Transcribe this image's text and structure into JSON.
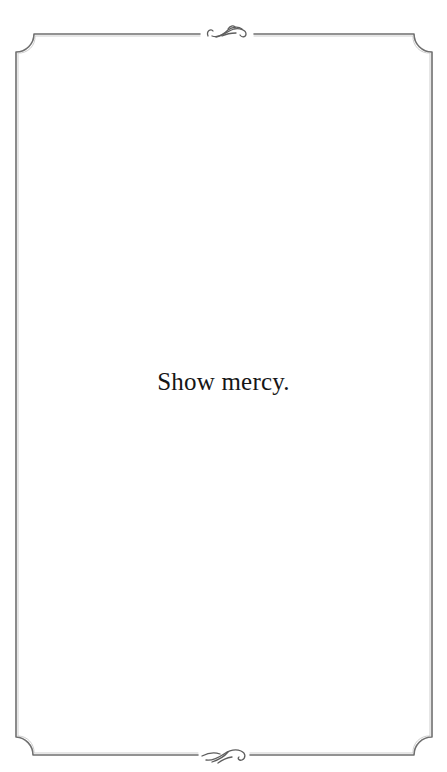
{
  "card": {
    "message": "Show mercy.",
    "background": "#ffffff",
    "text_color": "#161616",
    "border_color": "#6f6f6f"
  },
  "ornaments": {
    "top": "flourish-ornament",
    "bottom": "flourish-ornament"
  }
}
